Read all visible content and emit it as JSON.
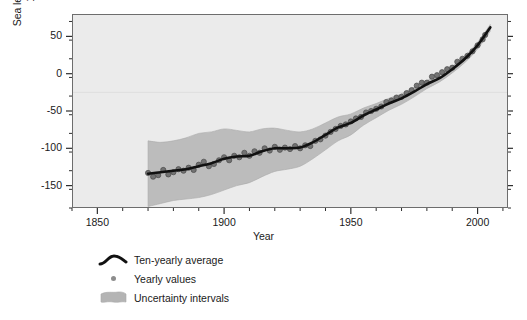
{
  "chart_data": {
    "type": "line",
    "title": "",
    "xlabel": "Year",
    "ylabel_line1": "Sea level difference (mm) from",
    "ylabel_line2": "1961–1990 average",
    "xlim": [
      1840,
      2012
    ],
    "ylim": [
      -180,
      80
    ],
    "xticks": [
      1850,
      1900,
      1950,
      2000
    ],
    "xtick_labels": [
      "1850",
      "1900",
      "1950",
      "2000"
    ],
    "xminor_step": 10,
    "yticks": [
      50,
      0,
      -50,
      -100,
      -150
    ],
    "ytick_labels": [
      "50",
      "0",
      "-50",
      "-100",
      "-150"
    ],
    "yminor_step": 25,
    "grid": "single faint horizontal line at -25",
    "gridline_y": -25,
    "plot_bg": "#ebebeb",
    "page_bg": "#ffffff",
    "frame_color": "#6d6d6d",
    "legend_position": "below-axes-left",
    "series": [
      {
        "name": "Ten-yearly average",
        "type": "line",
        "color": "#111111",
        "x": [
          1870,
          1875,
          1880,
          1885,
          1890,
          1895,
          1900,
          1905,
          1910,
          1915,
          1920,
          1925,
          1930,
          1935,
          1940,
          1945,
          1950,
          1955,
          1960,
          1965,
          1970,
          1975,
          1980,
          1985,
          1990,
          1995,
          2000,
          2005
        ],
        "values": [
          -134,
          -132,
          -130,
          -128,
          -124,
          -120,
          -114,
          -111,
          -110,
          -104,
          -100,
          -100,
          -99,
          -92,
          -82,
          -72,
          -66,
          -56,
          -48,
          -40,
          -33,
          -24,
          -14,
          -6,
          6,
          20,
          38,
          62
        ]
      },
      {
        "name": "Yearly values",
        "type": "scatter",
        "color": "#6e6e6e",
        "x": [
          1870,
          1872,
          1874,
          1876,
          1878,
          1880,
          1882,
          1884,
          1886,
          1888,
          1890,
          1892,
          1894,
          1896,
          1898,
          1900,
          1902,
          1904,
          1906,
          1908,
          1910,
          1912,
          1914,
          1916,
          1918,
          1920,
          1922,
          1924,
          1926,
          1928,
          1930,
          1932,
          1934,
          1936,
          1938,
          1940,
          1942,
          1944,
          1946,
          1948,
          1950,
          1952,
          1954,
          1956,
          1958,
          1960,
          1962,
          1964,
          1966,
          1968,
          1970,
          1972,
          1974,
          1976,
          1978,
          1980,
          1982,
          1984,
          1986,
          1988,
          1990,
          1992,
          1994,
          1996,
          1998,
          2000,
          2002,
          2003
        ],
        "values": [
          -133,
          -138,
          -136,
          -129,
          -135,
          -132,
          -128,
          -130,
          -126,
          -129,
          -122,
          -118,
          -124,
          -121,
          -116,
          -112,
          -116,
          -110,
          -112,
          -106,
          -110,
          -104,
          -106,
          -100,
          -103,
          -98,
          -102,
          -99,
          -101,
          -97,
          -100,
          -96,
          -97,
          -90,
          -88,
          -83,
          -78,
          -74,
          -70,
          -68,
          -64,
          -60,
          -58,
          -52,
          -50,
          -47,
          -44,
          -38,
          -36,
          -32,
          -31,
          -26,
          -22,
          -16,
          -12,
          -12,
          -4,
          -2,
          2,
          6,
          8,
          16,
          20,
          24,
          30,
          38,
          46,
          52
        ]
      },
      {
        "name": "Uncertainty intervals",
        "type": "band",
        "color": "#b4b4b4",
        "x": [
          1870,
          1875,
          1880,
          1885,
          1890,
          1895,
          1900,
          1905,
          1910,
          1915,
          1920,
          1925,
          1930,
          1935,
          1940,
          1945,
          1950,
          1955,
          1960,
          1965,
          1970,
          1975,
          1980,
          1985,
          1990,
          1995,
          2000,
          2005
        ],
        "upper": [
          -90,
          -92,
          -90,
          -86,
          -80,
          -78,
          -74,
          -76,
          -78,
          -74,
          -73,
          -76,
          -78,
          -74,
          -66,
          -58,
          -54,
          -46,
          -40,
          -33,
          -27,
          -18,
          -9,
          -2,
          10,
          24,
          42,
          66
        ],
        "lower": [
          -178,
          -174,
          -170,
          -168,
          -166,
          -162,
          -156,
          -150,
          -146,
          -138,
          -131,
          -128,
          -124,
          -114,
          -102,
          -90,
          -82,
          -69,
          -59,
          -49,
          -41,
          -31,
          -20,
          -11,
          1,
          15,
          33,
          57
        ]
      }
    ],
    "legend": [
      {
        "label": "Ten-yearly average",
        "marker": "line-curve",
        "color": "#111111"
      },
      {
        "label": "Yearly values",
        "marker": "dot",
        "color": "#8d8d8d"
      },
      {
        "label": "Uncertainty intervals",
        "marker": "band-patch",
        "color": "#b4b4b4"
      }
    ]
  }
}
